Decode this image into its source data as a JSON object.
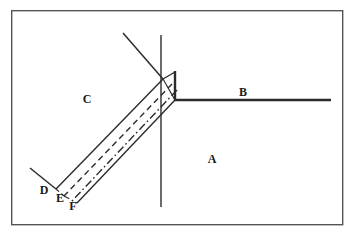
{
  "figure": {
    "background_color": "#ffffff",
    "ink_color": "#2b2b2b",
    "frame": {
      "name": "outer-border",
      "x": 11,
      "y": 10,
      "width": 332,
      "height": 215,
      "stroke_width": 1.4,
      "color": "#555555"
    },
    "labels": [
      {
        "id": "A",
        "text": "A",
        "x": 212,
        "y": 163
      },
      {
        "id": "B",
        "text": "B",
        "x": 243,
        "y": 96
      },
      {
        "id": "C",
        "text": "C",
        "x": 87,
        "y": 103
      },
      {
        "id": "D",
        "text": "D",
        "x": 44,
        "y": 194
      },
      {
        "id": "E",
        "text": "E",
        "x": 60,
        "y": 202
      },
      {
        "id": "F",
        "text": "F",
        "x": 73,
        "y": 209
      }
    ],
    "strokes": [
      {
        "name": "horizontal-ray-B",
        "style": "solid",
        "width": 2.6,
        "points": "175,100 331,100"
      },
      {
        "name": "vertical-riser-right",
        "style": "solid",
        "width": 2.2,
        "points": "175,100 175,72"
      },
      {
        "name": "apex-cap",
        "style": "solid",
        "width": 1.4,
        "points": "175,72 163,79"
      },
      {
        "name": "incident-ray-upper",
        "style": "solid",
        "width": 1.4,
        "points": "123,33 163,79"
      },
      {
        "name": "vertical-axis-line",
        "style": "solid",
        "width": 1.4,
        "points": "161,35 161,207"
      },
      {
        "name": "beam-edge-upper-solid",
        "style": "solid",
        "width": 1.4,
        "points": "163,79 56,189"
      },
      {
        "name": "beam-dashed-middle",
        "style": "dashed",
        "width": 1.4,
        "points": "172,84 64,196"
      },
      {
        "name": "beam-dashdot-lower",
        "style": "dashdot",
        "width": 1.4,
        "points": "177,90 72,201"
      },
      {
        "name": "beam-edge-lower-solid",
        "style": "solid",
        "width": 1.4,
        "points": "175,100 77,203"
      },
      {
        "name": "cross-diagonal-inner",
        "style": "solid",
        "width": 1.2,
        "points": "163,79 175,100"
      },
      {
        "name": "left-short-ray-D",
        "style": "solid",
        "width": 1.4,
        "points": "30,168 56,189"
      },
      {
        "name": "endcap-D-E",
        "style": "dashed",
        "width": 1.2,
        "points": "56,189 64,196"
      },
      {
        "name": "endcap-E-F",
        "style": "dashdot",
        "width": 1.2,
        "points": "64,196 77,203"
      }
    ]
  }
}
